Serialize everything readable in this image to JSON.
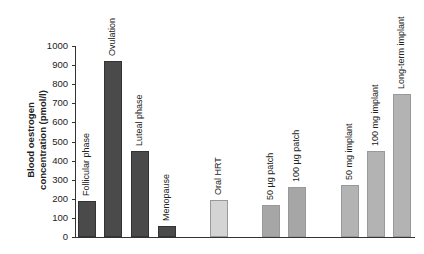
{
  "chart_data": {
    "type": "bar",
    "title": "",
    "xlabel": "",
    "ylabel": "Blood oestrogen concentration (pmol/l)",
    "ylabel_lines": [
      "Blood oestrogen",
      "concentration (pmol/l)"
    ],
    "ylim": [
      0,
      1000
    ],
    "yticks": [
      0,
      100,
      200,
      300,
      400,
      500,
      600,
      700,
      800,
      900,
      1000
    ],
    "grid": false,
    "legend": "none",
    "categories": [
      "Follicular phase",
      "Ovulation",
      "Luteal phase",
      "Menopause",
      "Oral HRT",
      "50 µg patch",
      "100 µg patch",
      "50 mg implant",
      "100 mg implant",
      "Long-term implant"
    ],
    "values": [
      190,
      920,
      450,
      55,
      195,
      165,
      262,
      272,
      450,
      750
    ],
    "colors": [
      "#4a4a4a",
      "#4a4a4a",
      "#4a4a4a",
      "#4a4a4a",
      "#d4d4d4",
      "#a6a6a6",
      "#a6a6a6",
      "#b3b3b3",
      "#b3b3b3",
      "#b3b3b3"
    ],
    "bar_x": [
      78,
      104,
      131,
      158,
      210,
      262,
      288,
      341,
      367,
      393
    ]
  }
}
